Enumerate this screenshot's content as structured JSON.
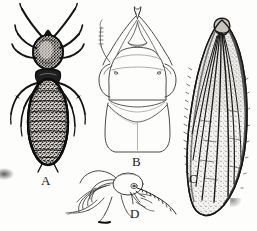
{
  "figure": {
    "domain": "scientific-illustration",
    "background_color": "#fdfdfb",
    "ink_color": "#1a1a1a",
    "width_px": 257,
    "height_px": 231
  },
  "panels": [
    {
      "id": "A",
      "label": "A",
      "name": "dorsal-habitus-soldier",
      "description": "Dorsal view of whole termite soldier: long curved antennae, rounded head capsule, pronotum, three pairs of legs and a shaded segmented abdomen",
      "label_x": 41,
      "label_y": 174,
      "fill_style": "dense-stipple-dark"
    },
    {
      "id": "B",
      "label": "B",
      "name": "head-capsule-dorsal",
      "description": "Dorsal view of head capsule and pronotum, with crossed mandibles, one antenna and eye lobes, outline only",
      "label_x": 132,
      "label_y": 155,
      "fill_style": "outline"
    },
    {
      "id": "C",
      "label": "C",
      "name": "forewing",
      "description": "Alate forewing showing scale at base, longitudinal veins and stippled membrane",
      "label_x": 189,
      "label_y": 172,
      "fill_style": "stipple-light"
    },
    {
      "id": "D",
      "label": "D",
      "name": "head-thorax-lateral",
      "description": "Lateral view of head, thorax and legs with antenna, outline only",
      "label_x": 130,
      "label_y": 207,
      "fill_style": "outline"
    }
  ],
  "labels": {
    "a": "A",
    "b": "B",
    "c": "C",
    "d": "D"
  }
}
